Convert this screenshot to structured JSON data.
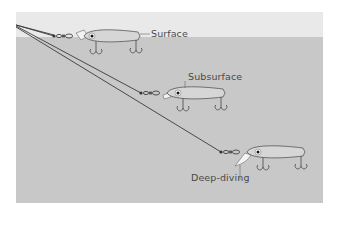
{
  "diagram": {
    "colors": {
      "sky": "#e9e9e9",
      "water": "#c8c8c8",
      "line": "#3a3a3a",
      "lure_body": "#d6d6d6",
      "lure_outline": "#555555",
      "label": "#4a4a4a"
    },
    "lures": [
      {
        "label": "Surface",
        "depth": "surface"
      },
      {
        "label": "Subsurface",
        "depth": "subsurface"
      },
      {
        "label": "Deep-diving",
        "depth": "deep"
      }
    ]
  }
}
